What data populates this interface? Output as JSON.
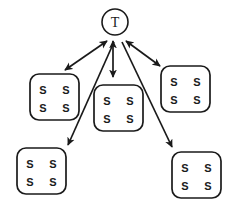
{
  "diagram": {
    "type": "node-link-diagram",
    "title": "",
    "background_color": "#ffffff",
    "stroke_color": "#1a1a1a",
    "canvas": {
      "width": 227,
      "height": 207
    },
    "nodes": [
      {
        "id": "t-node",
        "name": "teacher-node",
        "shape": "circle",
        "label": "T",
        "cx": 115,
        "cy": 22,
        "r": 13,
        "stroke_width": 1.6
      },
      {
        "id": "box-left-upper",
        "name": "student-group-left-upper",
        "shape": "rounded-rect",
        "x": 30,
        "y": 74,
        "width": 49,
        "height": 46,
        "rx": 9,
        "stroke_width": 1.7,
        "labels": [
          "S",
          "S",
          "S",
          "S"
        ]
      },
      {
        "id": "box-center",
        "name": "student-group-center",
        "shape": "rounded-rect",
        "x": 94,
        "y": 85,
        "width": 49,
        "height": 46,
        "rx": 9,
        "stroke_width": 1.7,
        "labels": [
          "S",
          "S",
          "S",
          "S"
        ]
      },
      {
        "id": "box-right-upper",
        "name": "student-group-right-upper",
        "shape": "rounded-rect",
        "x": 161,
        "y": 66,
        "width": 49,
        "height": 46,
        "rx": 9,
        "stroke_width": 1.7,
        "labels": [
          "S",
          "S",
          "S",
          "S"
        ]
      },
      {
        "id": "box-left-lower",
        "name": "student-group-left-lower",
        "shape": "rounded-rect",
        "x": 17,
        "y": 148,
        "width": 49,
        "height": 46,
        "rx": 9,
        "stroke_width": 1.7,
        "labels": [
          "S",
          "S",
          "S",
          "S"
        ]
      },
      {
        "id": "box-right-lower",
        "name": "student-group-right-lower",
        "shape": "rounded-rect",
        "x": 172,
        "y": 152,
        "width": 49,
        "height": 46,
        "rx": 9,
        "stroke_width": 1.7,
        "labels": [
          "S",
          "S",
          "S",
          "S"
        ]
      }
    ],
    "edges": [
      {
        "id": "edge-left-upper",
        "name": "edge-teacher-to-left-upper",
        "from": "t-node",
        "to": "box-left-upper",
        "arrowheads": "both",
        "x1": 107,
        "y1": 41,
        "x2": 65,
        "y2": 70,
        "stroke_width": 1.7
      },
      {
        "id": "edge-center",
        "name": "edge-teacher-to-center",
        "from": "t-node",
        "to": "box-center",
        "arrowheads": "both",
        "x1": 113,
        "y1": 41,
        "x2": 113,
        "y2": 77,
        "stroke_width": 1.7
      },
      {
        "id": "edge-right-upper",
        "name": "edge-teacher-to-right-upper",
        "from": "t-node",
        "to": "box-right-upper",
        "arrowheads": "both",
        "x1": 126,
        "y1": 41,
        "x2": 160,
        "y2": 66,
        "stroke_width": 1.7
      },
      {
        "id": "edge-left-lower",
        "name": "edge-teacher-to-left-lower",
        "from": "t-node",
        "to": "box-left-lower",
        "arrowheads": "end",
        "x1": 114,
        "y1": 42,
        "x2": 68,
        "y2": 145,
        "stroke_width": 1.7
      },
      {
        "id": "edge-right-lower",
        "name": "edge-teacher-to-right-lower",
        "from": "t-node",
        "to": "box-right-lower",
        "arrowheads": "end",
        "x1": 122,
        "y1": 42,
        "x2": 172,
        "y2": 147,
        "stroke_width": 1.7
      }
    ]
  }
}
